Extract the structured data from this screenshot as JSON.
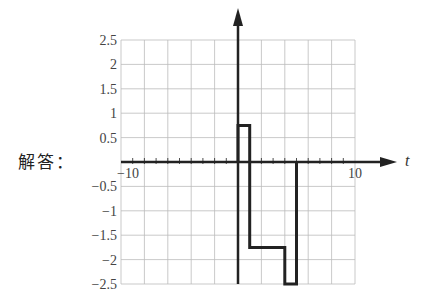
{
  "label": "解答：",
  "chart_data": {
    "type": "line",
    "title": "",
    "xlabel": "t",
    "ylabel": "",
    "xlim": [
      -10,
      10
    ],
    "ylim": [
      -2.5,
      2.5
    ],
    "grid": true,
    "x_tick_labels": [
      "-10",
      "10"
    ],
    "y_tick_labels": [
      "2.5",
      "2",
      "1.5",
      "1",
      "0.5",
      "-0.5",
      "-1",
      "-1.5",
      "-2",
      "-2.5"
    ],
    "x_grid_step": 2,
    "y_grid_step": 0.5,
    "series": [
      {
        "name": "x(t)",
        "step": true,
        "points": [
          [
            0,
            0
          ],
          [
            0,
            0.75
          ],
          [
            1,
            0.75
          ],
          [
            1,
            -1.75
          ],
          [
            4,
            -1.75
          ],
          [
            4,
            -2.5
          ],
          [
            5,
            -2.5
          ],
          [
            5,
            0
          ]
        ]
      }
    ]
  },
  "colors": {
    "grid": "#bbbbbb",
    "axis": "#222222",
    "signal": "#222222"
  }
}
